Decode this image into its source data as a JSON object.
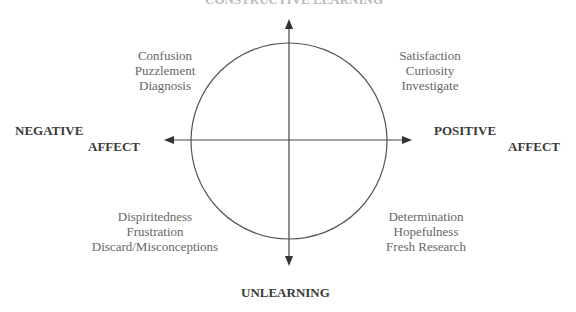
{
  "diagram": {
    "axes": {
      "top": "CONSTRUCTIVE LEARNING",
      "bottom": "UNLEARNING",
      "left_line1": "NEGATIVE",
      "left_line2": "AFFECT",
      "right_line1": "POSITIVE",
      "right_line2": "AFFECT"
    },
    "quadrants": {
      "top_left": [
        "Confusion",
        "Puzzlement",
        "Diagnosis"
      ],
      "top_right": [
        "Satisfaction",
        "Curiosity",
        "Investigate"
      ],
      "bottom_left": [
        "Dispiritedness",
        "Frustration",
        "Discard/Misconceptions"
      ],
      "bottom_right": [
        "Determination",
        "Hopefulness",
        "Fresh Research"
      ]
    },
    "colors": {
      "line": "#444444",
      "text": "#666666",
      "axis_text": "#3a3a3a"
    }
  }
}
